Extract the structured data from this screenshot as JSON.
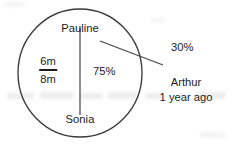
{
  "figure": {
    "type": "circle-diagram",
    "stroke_color": "#3a3a3a",
    "text_color": "#1b1b1b",
    "background_color": "#ffffff",
    "circle": {
      "cx": 80,
      "cy": 73,
      "rx": 62,
      "ry": 64
    },
    "diameter_line": {
      "x": 80,
      "y1": 28,
      "y2": 115
    },
    "leader_line": {
      "x1": 100,
      "y1": 41,
      "x2": 163,
      "y2": 65
    }
  },
  "labels": {
    "top": "Pauline",
    "bottom": "Sonia",
    "center_right": "75%",
    "callout_percent": "30%"
  },
  "fraction": {
    "numerator": "6m",
    "denominator": "8m"
  },
  "annotation": {
    "name": "Arthur",
    "time": "1 year ago"
  }
}
